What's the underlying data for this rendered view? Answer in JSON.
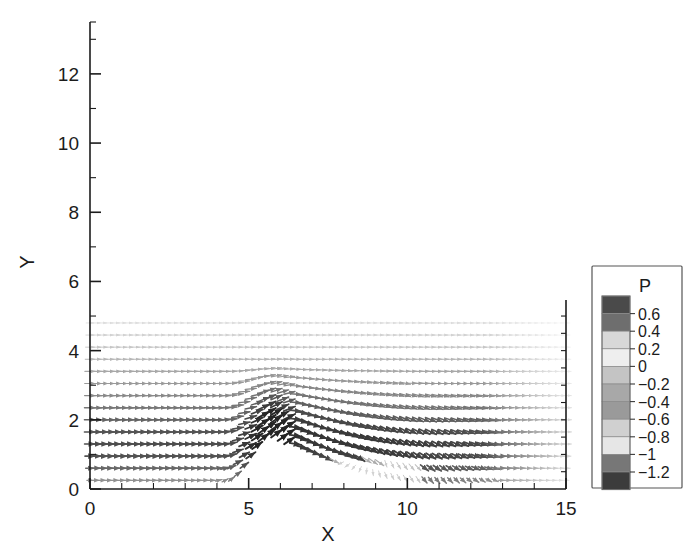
{
  "chart_data": {
    "type": "scatter",
    "plot_kind": "velocity-vector-field",
    "title": "",
    "xlabel": "X",
    "ylabel": "Y",
    "xlim": [
      0,
      15
    ],
    "ylim": [
      0,
      13.5
    ],
    "grid": false,
    "xticks_major": [
      0,
      5,
      10,
      15
    ],
    "xtick_labels": [
      "0",
      "5",
      "10",
      "15"
    ],
    "xticks_minor": [
      1,
      2,
      3,
      4,
      6,
      7,
      8,
      9,
      11,
      12,
      13,
      14
    ],
    "yticks_major": [
      0,
      2,
      4,
      6,
      8,
      10,
      12
    ],
    "ytick_labels": [
      "0",
      "2",
      "4",
      "6",
      "8",
      "10",
      "12"
    ],
    "yticks_minor": [
      1,
      3,
      5,
      7,
      9,
      11,
      13
    ],
    "legend": {
      "title": "P",
      "position": "right-outside",
      "labels": [
        "0.6",
        "0.4",
        "0.2",
        "0",
        "-0.2",
        "-0.4",
        "-0.6",
        "-0.8",
        "-1",
        "-1.2"
      ],
      "values": [
        0.6,
        0.4,
        0.2,
        0,
        -0.2,
        -0.4,
        -0.6,
        -0.8,
        -1,
        -1.2
      ],
      "band_colors": [
        "#4a4a4a",
        "#6e6e6e",
        "#d8d8d8",
        "#eeeeee",
        "#c4c4c4",
        "#a8a8a8",
        "#9a9a9a",
        "#d0d0d0",
        "#e6e6e6",
        "#777777",
        "#3c3c3c"
      ]
    },
    "field_description": "Two-dimensional velocity vector field over a ramp/hill showing an incoming boundary layer, upward deflection near x=5, a separated shear layer and recirculation region downstream, with reattachment near x=10.",
    "field_extent": {
      "x_min": 0.0,
      "x_max": 15.0,
      "y_min": 0.1,
      "y_max": 5.0
    },
    "rows": [
      {
        "y": 0.25,
        "darkness": 0.95,
        "scale": 1.0
      },
      {
        "y": 0.6,
        "darkness": 0.92,
        "scale": 1.0
      },
      {
        "y": 0.95,
        "darkness": 0.88,
        "scale": 0.98
      },
      {
        "y": 1.3,
        "darkness": 0.82,
        "scale": 0.96
      },
      {
        "y": 1.65,
        "darkness": 0.74,
        "scale": 0.93
      },
      {
        "y": 2.0,
        "darkness": 0.64,
        "scale": 0.9
      },
      {
        "y": 2.35,
        "darkness": 0.55,
        "scale": 0.87
      },
      {
        "y": 2.7,
        "darkness": 0.47,
        "scale": 0.84
      },
      {
        "y": 3.05,
        "darkness": 0.4,
        "scale": 0.81
      },
      {
        "y": 3.4,
        "darkness": 0.34,
        "scale": 0.78
      },
      {
        "y": 3.75,
        "darkness": 0.29,
        "scale": 0.75
      },
      {
        "y": 4.1,
        "darkness": 0.24,
        "scale": 0.72
      },
      {
        "y": 4.45,
        "darkness": 0.2,
        "scale": 0.69
      },
      {
        "y": 4.8,
        "darkness": 0.16,
        "scale": 0.66
      }
    ],
    "ramp": {
      "x_start": 4.3,
      "x_crest": 5.8,
      "x_end": 11.0,
      "crest_height": 1.5
    },
    "recirculation": {
      "x_center": 7.4,
      "y_center": 0.7,
      "x_extent": [
        5.6,
        10.4
      ]
    }
  }
}
